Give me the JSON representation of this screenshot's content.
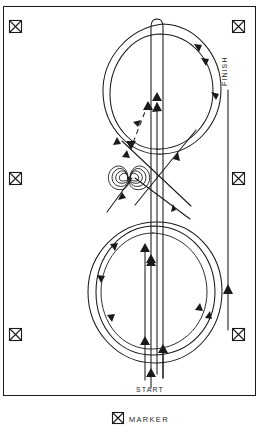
{
  "diagram": {
    "canvas": {
      "width": 259,
      "height": 442
    },
    "frame": {
      "x": 3,
      "y": 6,
      "width": 253,
      "height": 390,
      "stroke": "#1a1a1a"
    },
    "colors": {
      "ink": "#1a1a1a",
      "text": "#2a2a2a",
      "background": "#ffffff"
    },
    "labels": {
      "start": "START",
      "finish": "FINISH"
    },
    "legend": {
      "marker_label": "MARKER",
      "icon_name": "crossed-square-marker-icon"
    },
    "markers": [
      {
        "id": "marker-top-left",
        "x": 15,
        "y": 26,
        "size": 13
      },
      {
        "id": "marker-top-right",
        "x": 238,
        "y": 26,
        "size": 13
      },
      {
        "id": "marker-mid-left",
        "x": 15,
        "y": 178,
        "size": 13
      },
      {
        "id": "marker-mid-right",
        "x": 238,
        "y": 178,
        "size": 13
      },
      {
        "id": "marker-bottom-left",
        "x": 15,
        "y": 334,
        "size": 13
      },
      {
        "id": "marker-bottom-right",
        "x": 238,
        "y": 334,
        "size": 13
      }
    ],
    "legend_icon": {
      "x": 123,
      "y": 415,
      "size": 11
    },
    "elements": {
      "upper_loop": "large circular loop in the upper half of the course",
      "lower_loop": "large circular loop in the lower half of the course",
      "crossover": "spiral cusp crossing point at the waist of the figure eight",
      "dashed_path": "dashed entry path with directional arrowheads",
      "finish_line": "straight vertical finish run on the right side",
      "start_run": "vertical start run at the bottom centre"
    }
  }
}
